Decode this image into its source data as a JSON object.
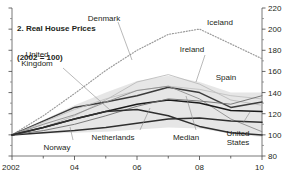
{
  "chart_data": {
    "type": "line",
    "title": "2. Real House Prices",
    "subtitle": "(2002 = 100)",
    "xlabel": "",
    "ylabel": "",
    "xlim": [
      2002,
      2010
    ],
    "ylim": [
      80,
      220
    ],
    "ytick_labels": [
      "220",
      "200",
      "180",
      "160",
      "140",
      "120",
      "100",
      "80"
    ],
    "ytick_values": [
      220,
      200,
      180,
      160,
      140,
      120,
      100,
      80
    ],
    "ytick_side": "right",
    "xtick_labels": [
      "2002",
      "04",
      "06",
      "08",
      "10"
    ],
    "xtick_values": [
      2002,
      2004,
      2006,
      2008,
      2010
    ],
    "grid": false,
    "legend": "inline-annotations",
    "x": [
      2002,
      2003,
      2004,
      2005,
      2006,
      2007,
      2008,
      2009,
      2010
    ],
    "series": [
      {
        "name": "Iceland",
        "style": "dotted",
        "color": "#9a9a9a",
        "values": [
          100,
          118,
          139,
          161,
          180,
          195,
          200,
          186,
          172
        ]
      },
      {
        "name": "Denmark",
        "style": "solid-light",
        "color": "#b5b5b5",
        "values": [
          100,
          107,
          118,
          133,
          150,
          157,
          148,
          133,
          128
        ]
      },
      {
        "name": "United Kingdom",
        "style": "solid-dark",
        "color": "#3b3b3b",
        "values": [
          100,
          113,
          126,
          131,
          137,
          145,
          140,
          126,
          131
        ]
      },
      {
        "name": "Spain",
        "style": "solid-light",
        "color": "#bdbdbd",
        "values": [
          100,
          112,
          124,
          134,
          142,
          146,
          143,
          137,
          134
        ]
      },
      {
        "name": "Ireland",
        "style": "solid-mid",
        "color": "#8c8c8c",
        "values": [
          100,
          110,
          119,
          131,
          142,
          146,
          134,
          115,
          103
        ]
      },
      {
        "name": "Netherlands",
        "style": "solid-dark",
        "color": "#2e2e2e",
        "values": [
          100,
          102,
          104,
          107,
          111,
          115,
          116,
          113,
          112
        ]
      },
      {
        "name": "Median",
        "style": "solid-dark",
        "color": "#1a1a1a",
        "values": [
          100,
          107,
          115,
          122,
          129,
          133,
          130,
          123,
          122
        ]
      },
      {
        "name": "Norway",
        "style": "solid-mid",
        "color": "#6e6e6e",
        "values": [
          100,
          104,
          110,
          118,
          127,
          134,
          132,
          129,
          137
        ]
      },
      {
        "name": "United States",
        "style": "solid-dark",
        "color": "#2e2e2e",
        "values": [
          100,
          107,
          115,
          122,
          124,
          118,
          108,
          102,
          100
        ]
      },
      {
        "name": "band-upper",
        "style": "band",
        "color": "#d9d9d9",
        "values": [
          100,
          114,
          128,
          140,
          151,
          156,
          150,
          140,
          140
        ]
      },
      {
        "name": "band-lower",
        "style": "band",
        "color": "#d9d9d9",
        "values": [
          100,
          101,
          102,
          103,
          105,
          107,
          106,
          101,
          98
        ]
      }
    ],
    "annotations": [
      {
        "text": "Denmark",
        "x_px": 104,
        "y_px": 14
      },
      {
        "text": "Iceland",
        "x_px": 220,
        "y_px": 18
      },
      {
        "text": "United\nKingdom",
        "x_px": 37,
        "y_px": 50
      },
      {
        "text": "Ireland",
        "x_px": 192,
        "y_px": 45
      },
      {
        "text": "Spain",
        "x_px": 226,
        "y_px": 73
      },
      {
        "text": "Netherlands",
        "x_px": 113,
        "y_px": 133
      },
      {
        "text": "Median",
        "x_px": 186,
        "y_px": 133
      },
      {
        "text": "United\nStates",
        "x_px": 238,
        "y_px": 129
      },
      {
        "text": "Norway",
        "x_px": 57,
        "y_px": 143
      }
    ]
  }
}
